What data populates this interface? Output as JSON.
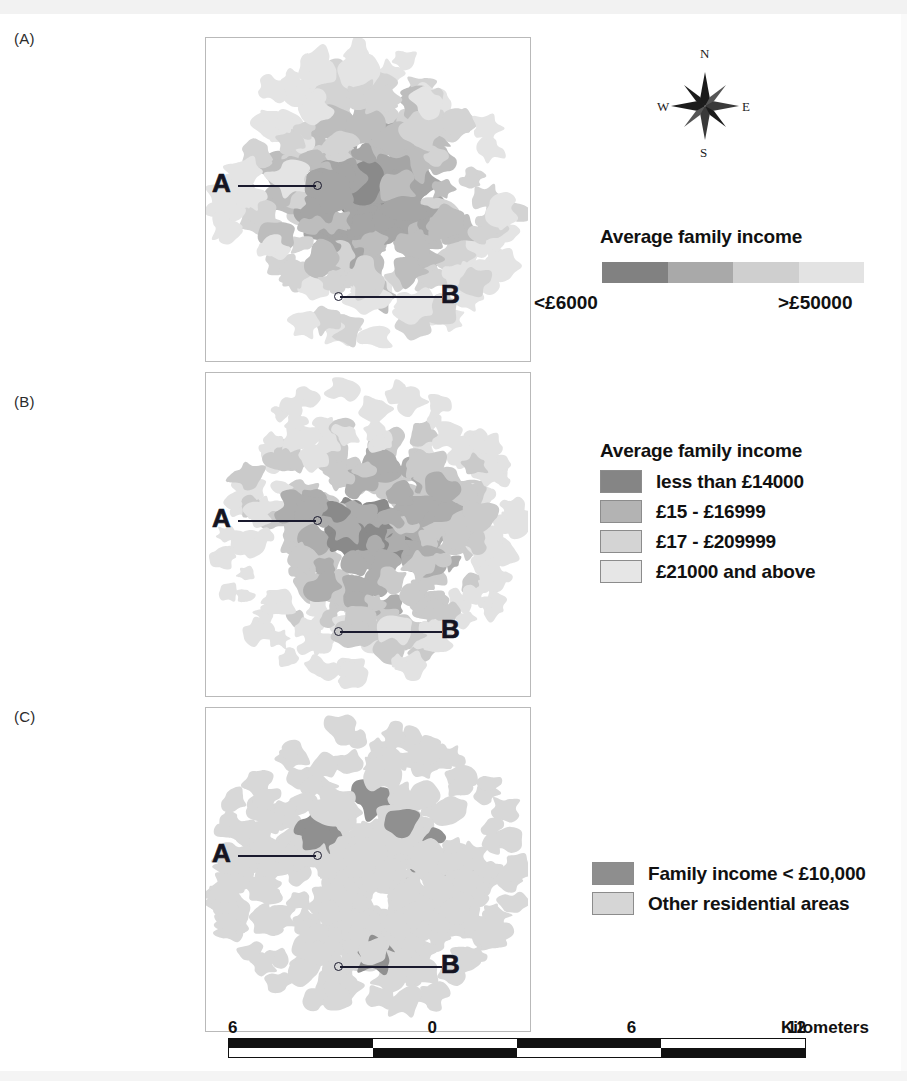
{
  "figure": {
    "panels": [
      {
        "id": "A",
        "label": "(A)"
      },
      {
        "id": "B",
        "label": "(B)"
      },
      {
        "id": "C",
        "label": "(C)"
      }
    ],
    "point_labels": {
      "a": "A",
      "b": "B"
    }
  },
  "compass": {
    "north": "N",
    "south": "S",
    "east": "E",
    "west": "W",
    "icon": "compass-rose-icon"
  },
  "legend_a": {
    "title": "Average family income",
    "low_label": "<£6000",
    "high_label": ">£50000",
    "gradient_colors": [
      "#818181",
      "#a9a9a9",
      "#cfcfcf",
      "#e3e3e3"
    ]
  },
  "legend_b": {
    "title": "Average family income",
    "classes": [
      {
        "label": "less than £14000",
        "color": "#858585"
      },
      {
        "label": "£15 - £16999",
        "color": "#b3b3b3"
      },
      {
        "label": "£17 - £209999",
        "color": "#d4d4d4"
      },
      {
        "label": "£21000 and above",
        "color": "#e6e6e6"
      }
    ]
  },
  "legend_c": {
    "classes": [
      {
        "label": "Family income < £10,000",
        "color": "#8e8e8e"
      },
      {
        "label": "Other residential areas",
        "color": "#d6d6d6"
      }
    ]
  },
  "scale": {
    "ticks": [
      "6",
      "0",
      "6",
      "12"
    ],
    "units": "Kilometers",
    "pattern": [
      "#111111",
      "#ffffff",
      "#111111",
      "#ffffff"
    ]
  },
  "chart_data": {
    "type": "map",
    "panels": [
      {
        "id": "A",
        "style": "continuous-gradient",
        "legend_title": "Average family income",
        "range": [
          "<£6000",
          ">£50000"
        ],
        "markers": [
          "A",
          "B"
        ]
      },
      {
        "id": "B",
        "style": "classified-4",
        "legend_title": "Average family income",
        "classes": [
          "less than £14000",
          "£15 - £16999",
          "£17 - £209999",
          "£21000 and above"
        ],
        "markers": [
          "A",
          "B"
        ]
      },
      {
        "id": "C",
        "style": "binary",
        "classes": [
          "Family income < £10,000",
          "Other residential areas"
        ],
        "markers": [
          "A",
          "B"
        ]
      }
    ],
    "scale_bar": {
      "ticks": [
        6,
        0,
        6,
        12
      ],
      "units": "Kilometers"
    }
  }
}
